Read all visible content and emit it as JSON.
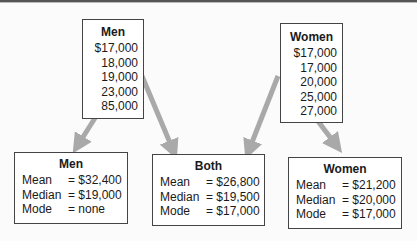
{
  "sources": {
    "men": {
      "title": "Men",
      "values": [
        "$17,000",
        "18,000",
        "19,000",
        "23,000",
        "85,000"
      ]
    },
    "women": {
      "title": "Women",
      "values": [
        "$17,000",
        "17,000",
        "20,000",
        "25,000",
        "27,000"
      ]
    }
  },
  "results": {
    "men": {
      "title": "Men",
      "rows": [
        {
          "label": "Mean",
          "value": "= $32,400"
        },
        {
          "label": "Median",
          "value": "= $19,000"
        },
        {
          "label": "Mode",
          "value": "= none"
        }
      ]
    },
    "both": {
      "title": "Both",
      "rows": [
        {
          "label": "Mean",
          "value": "= $26,800"
        },
        {
          "label": "Median",
          "value": "= $19,500"
        },
        {
          "label": "Mode",
          "value": "= $17,000"
        }
      ]
    },
    "women": {
      "title": "Women",
      "rows": [
        {
          "label": "Mean",
          "value": "= $21,200"
        },
        {
          "label": "Median",
          "value": "= $20,000"
        },
        {
          "label": "Mode",
          "value": "= $17,000"
        }
      ]
    }
  },
  "colors": {
    "arrow": "#a9a9a9",
    "border": "#444444"
  }
}
